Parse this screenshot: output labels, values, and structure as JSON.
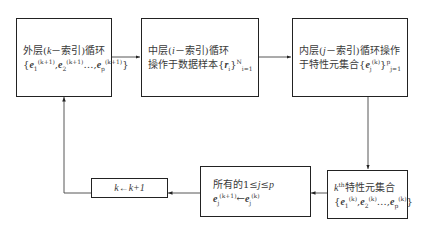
{
  "diagram": {
    "type": "flowchart",
    "nodes": [
      {
        "id": "outer-loop",
        "line1": "外层(k－索引)循环",
        "line2": "{e1(k+1), e2(k+1)…, ep(k+1)}"
      },
      {
        "id": "middle-loop",
        "line1": "中层(i－索引)循环",
        "line2": "操作于数据样本{ri}i=1N"
      },
      {
        "id": "inner-loop",
        "line1": "内层(j－索引)循环操作",
        "line2": "于特性元集合{ej(k)}j=1p"
      },
      {
        "id": "kth-set",
        "line1": "kth特性元集合",
        "line2": "{e1(k), e2(k)…, ep(k)}"
      },
      {
        "id": "update-all",
        "line1": "所有的1≤j≤p",
        "line2": "ej(k+1)←ej(k)"
      },
      {
        "id": "increment",
        "line1": "k←k+1"
      }
    ],
    "edges": [
      {
        "from": "outer-loop",
        "to": "middle-loop"
      },
      {
        "from": "middle-loop",
        "to": "inner-loop"
      },
      {
        "from": "inner-loop",
        "to": "kth-set"
      },
      {
        "from": "kth-set",
        "to": "update-all"
      },
      {
        "from": "update-all",
        "to": "increment"
      },
      {
        "from": "increment",
        "to": "outer-loop"
      }
    ],
    "labels": {
      "outer_prefix": "外层(",
      "outer_k": "k",
      "outer_suffix": "－索引)循环",
      "mid_prefix": "中层(",
      "mid_i": "i",
      "mid_suffix": "－索引)循环",
      "mid_line2": "操作于数据样本",
      "inner_prefix": "内层(",
      "inner_j": "j",
      "inner_suffix": "－索引)循环操作",
      "inner_line2": "于特性元集合",
      "kth_k": "k",
      "kth_th": "th",
      "kth_suffix": "特性元集合",
      "update_line1_prefix": "所有的1≤",
      "update_line1_j": "j",
      "update_line1_suffix": "≤",
      "update_line1_p": "p",
      "increment": "k←k+1"
    }
  }
}
